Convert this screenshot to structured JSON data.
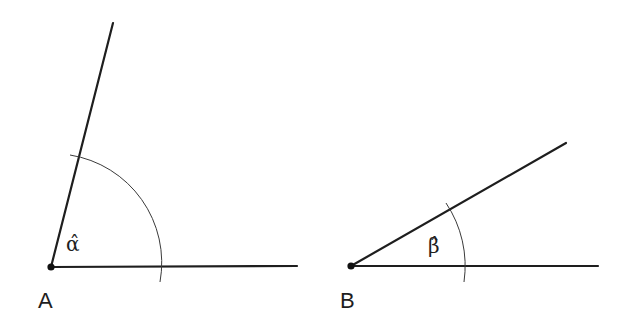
{
  "diagram": {
    "colors": {
      "line": "#1e1e1e",
      "arc": "#3a3a3a",
      "background": "#ffffff"
    },
    "angles": [
      {
        "vertex_label": "A",
        "angle_label": "α̂",
        "vertex": [
          51,
          267
        ],
        "ray_horizontal_end": [
          297,
          266
        ],
        "ray_inclined_end": [
          113,
          23
        ],
        "arc_radius": 109
      },
      {
        "vertex_label": "B",
        "angle_label": "β̂",
        "vertex": [
          351,
          266
        ],
        "ray_horizontal_end": [
          598,
          266
        ],
        "ray_inclined_end": [
          566,
          143
        ],
        "arc_radius": 113
      }
    ]
  }
}
